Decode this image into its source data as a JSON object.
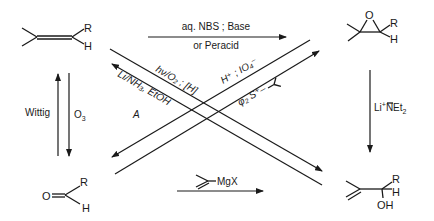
{
  "compounds": {
    "alkene": {
      "label": "trisubstituted alkene",
      "R": "R",
      "H": "H"
    },
    "epoxide": {
      "label": "epoxide",
      "O": "O",
      "R": "R",
      "H": "H"
    },
    "aldehyde": {
      "label": "aldehyde",
      "O": "O",
      "R": "R",
      "H": "H"
    },
    "allylic_alcohol": {
      "label": "allylic alcohol",
      "R": "R",
      "H": "H",
      "OH": "OH"
    }
  },
  "reactions": {
    "top": {
      "line1": "aq. NBS ; Base",
      "line2": "or Peracid"
    },
    "left_up": {
      "label": "Wittig"
    },
    "left_down": {
      "label": "O",
      "sub": "3"
    },
    "right_down": {
      "label": "Li",
      "sup": "+",
      "label2": "NEt",
      "sub": "2"
    },
    "bottom": {
      "label": "MgX"
    },
    "diag_photo": {
      "label": "hν/O₂ ; [H]"
    },
    "diag_birch": {
      "label": "Li/NH₃, EtOH",
      "label2": "A"
    },
    "diag_cleave": {
      "label": "H⁺ ; IO₄⁻"
    },
    "diag_ylide": {
      "label": "φ₂ S⁺–"
    }
  },
  "colors": {
    "ink": "#1a1a1a",
    "background": "#ffffff"
  }
}
